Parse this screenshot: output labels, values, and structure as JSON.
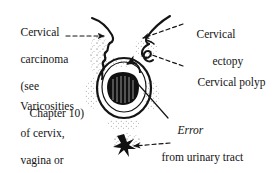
{
  "figure": {
    "type": "medical-line-diagram",
    "ink_color": "#141414",
    "background_color": "#ffffff"
  },
  "labels": {
    "cervical_carcinoma": {
      "line1": "Cervical",
      "line2": "carcinoma",
      "line3": "(see",
      "line4": "Chapter 10)"
    },
    "varicosities": {
      "line1": "Varicosities",
      "line2": "of cervix,",
      "line3": "vagina or",
      "line4": "vulva"
    },
    "cervical_ectopy": {
      "line1": "Cervical",
      "line2": "ectopy"
    },
    "cervical_polyp": {
      "line1": "Cervical polyp"
    },
    "error": {
      "line1": "Error",
      "line2": "from urinary tract",
      "line3": "or haemorrhoids"
    }
  },
  "leaders": [
    {
      "name": "leader-cervical-carcinoma",
      "style": "dashed-arrow",
      "direction": "left-to-right"
    },
    {
      "name": "leader-cervical-ectopy",
      "style": "dashed-arrow",
      "direction": "right-to-left"
    },
    {
      "name": "leader-cervical-polyp",
      "style": "dashed-line",
      "direction": "right-to-left"
    },
    {
      "name": "leader-error",
      "style": "solid-line",
      "direction": "right-to-left"
    },
    {
      "name": "leader-varicosities-lower",
      "style": "dashed-arrow",
      "direction": "right-to-left"
    }
  ],
  "artwork_parts": [
    {
      "name": "vaginal-wall-left",
      "description": "curved line upper left of speculum view"
    },
    {
      "name": "vaginal-wall-right",
      "description": "curved line upper right of speculum view"
    },
    {
      "name": "carcinoma-lesion",
      "description": "irregular wavy outline on left of cervix"
    },
    {
      "name": "cervical-polyp-shape",
      "description": "small hooked loop on upper right"
    },
    {
      "name": "cervix-outline",
      "description": "large oval body of the cervix"
    },
    {
      "name": "ectopy-patch",
      "description": "dark stippled patch at the cervical os"
    },
    {
      "name": "varicosity-star",
      "description": "small dark star-shaped vessel cluster below cervix"
    },
    {
      "name": "stipple-shading",
      "description": "dotted stipple shading around the structures"
    }
  ]
}
